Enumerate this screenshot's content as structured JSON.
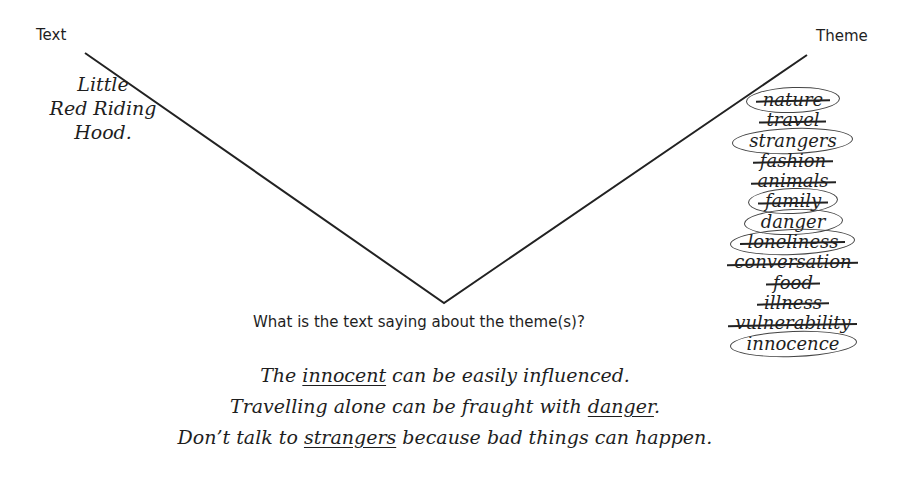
{
  "labels": {
    "left_heading": "Text",
    "right_heading": "Theme",
    "question": "What is the text saying about the theme(s)?"
  },
  "text_title": {
    "lines": [
      "Little",
      "Red Riding",
      "Hood."
    ]
  },
  "diagram": {
    "shape": "V",
    "left_top": [
      85,
      53
    ],
    "vertex": [
      444,
      303
    ],
    "right_top": [
      807,
      55
    ],
    "line_color": "#222222"
  },
  "themes": [
    {
      "word": "nature",
      "crossed": true,
      "circled": true
    },
    {
      "word": "travel",
      "crossed": true,
      "circled": false
    },
    {
      "word": "strangers",
      "crossed": false,
      "circled": true
    },
    {
      "word": "fashion",
      "crossed": true,
      "circled": false
    },
    {
      "word": "animals",
      "crossed": true,
      "circled": false
    },
    {
      "word": "family",
      "crossed": true,
      "circled": true
    },
    {
      "word": "danger",
      "crossed": false,
      "circled": true
    },
    {
      "word": "loneliness",
      "crossed": true,
      "circled": true
    },
    {
      "word": "conversation",
      "crossed": true,
      "circled": false
    },
    {
      "word": "food",
      "crossed": true,
      "circled": false
    },
    {
      "word": "illness",
      "crossed": true,
      "circled": false
    },
    {
      "word": "vulnerability",
      "crossed": true,
      "circled": false
    },
    {
      "word": "innocence",
      "crossed": false,
      "circled": true
    }
  ],
  "answers": [
    {
      "before": "The ",
      "underlined": "innocent",
      "after": " can be easily influenced."
    },
    {
      "before": "Travelling alone can be fraught with ",
      "underlined": "danger",
      "after": "."
    },
    {
      "before": "Don’t talk to ",
      "underlined": "strangers",
      "after": " because bad things can happen."
    }
  ]
}
